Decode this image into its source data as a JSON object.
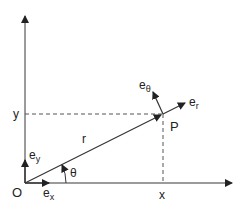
{
  "diagram": {
    "labels": {
      "origin": "O",
      "x_axis": "x",
      "y_axis": "y",
      "radius": "r",
      "point": "P",
      "angle": "θ",
      "ex": "e",
      "ex_sub": "x",
      "ey": "e",
      "ey_sub": "y",
      "er": "e",
      "er_sub": "r",
      "etheta": "e",
      "etheta_sub": "θ"
    },
    "colors": {
      "axis": "#7a7a7a",
      "line": "#333333",
      "text": "#222222"
    }
  }
}
